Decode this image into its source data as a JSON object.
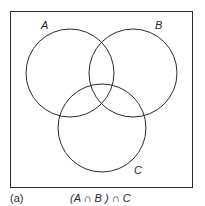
{
  "diagram": {
    "type": "venn",
    "sets": [
      {
        "id": "A",
        "label": "A"
      },
      {
        "id": "B",
        "label": "B"
      },
      {
        "id": "C",
        "label": "C"
      }
    ],
    "caption_tag": "(a)",
    "caption_expression": "(A ∩ B ) ∩ C",
    "colors": {
      "stroke": "#2a2a2a",
      "background": "#ffffff"
    }
  }
}
